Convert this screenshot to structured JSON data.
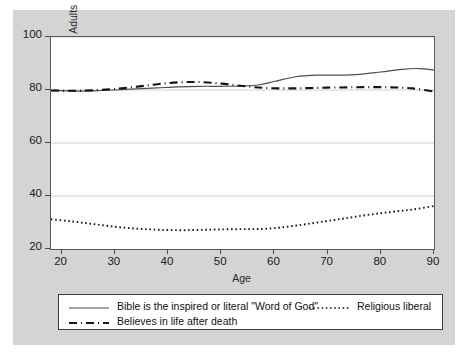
{
  "chart_data": {
    "type": "line",
    "title": "",
    "xlabel": "Age",
    "ylabel": "Percent of U.S. Adults",
    "xlim": [
      18,
      90
    ],
    "ylim": [
      20,
      100
    ],
    "xticks": [
      20,
      30,
      40,
      50,
      60,
      70,
      80,
      90
    ],
    "yticks": [
      20,
      40,
      60,
      80,
      100
    ],
    "grid": true,
    "grid_axis": "y",
    "legend_position": "below-plot",
    "series": [
      {
        "name": "Bible is the inspired or literal \"Word of God\"",
        "style": "solid",
        "color": "#4d4d4d",
        "x": [
          18,
          22,
          26,
          30,
          34,
          38,
          42,
          46,
          50,
          54,
          57,
          60,
          64,
          68,
          72,
          76,
          80,
          84,
          87,
          90
        ],
        "values": [
          79.9,
          79.6,
          79.7,
          80.0,
          80.4,
          80.8,
          81.2,
          81.4,
          81.4,
          81.5,
          81.9,
          83.2,
          85.0,
          85.6,
          85.6,
          85.9,
          86.8,
          87.8,
          88.1,
          87.6
        ]
      },
      {
        "name": "Religious liberal",
        "style": "dotted",
        "color": "#1a1a1a",
        "x": [
          18,
          22,
          26,
          30,
          34,
          38,
          42,
          46,
          50,
          54,
          58,
          62,
          66,
          70,
          74,
          78,
          82,
          86,
          90
        ],
        "values": [
          31.2,
          30.4,
          29.4,
          28.4,
          27.7,
          27.3,
          27.1,
          27.2,
          27.4,
          27.5,
          27.6,
          28.3,
          29.4,
          30.6,
          31.8,
          33.0,
          34.0,
          34.9,
          36.2
        ]
      },
      {
        "name": "Believes in life after death",
        "style": "dashed",
        "color": "#141414",
        "x": [
          18,
          22,
          26,
          30,
          34,
          38,
          42,
          46,
          50,
          54,
          58,
          62,
          66,
          70,
          74,
          78,
          82,
          86,
          90
        ],
        "values": [
          79.8,
          79.7,
          79.9,
          80.4,
          81.2,
          82.2,
          82.9,
          83.0,
          82.4,
          81.5,
          80.8,
          80.6,
          80.7,
          80.9,
          81.0,
          81.1,
          81.0,
          80.6,
          79.4
        ]
      }
    ]
  },
  "axis": {
    "y_title": "Percent of U.S. Adults",
    "x_title": "Age",
    "y_tick_labels": [
      "100",
      "80",
      "60",
      "40",
      "20"
    ],
    "x_tick_labels": [
      "20",
      "30",
      "40",
      "50",
      "60",
      "70",
      "80",
      "90"
    ]
  },
  "legend": {
    "entries": [
      {
        "label": "Bible is the inspired or literal \"Word of God\"",
        "style": "solid"
      },
      {
        "label": "Religious liberal",
        "style": "dotted"
      },
      {
        "label": "Believes in life after death",
        "style": "dashed"
      }
    ]
  },
  "colors": {
    "figure_background": "#d4d4d4",
    "plot_background": "#ffffff",
    "gridline": "#d0d0d0",
    "frame": "#5a5a5a",
    "line": "#333333"
  }
}
